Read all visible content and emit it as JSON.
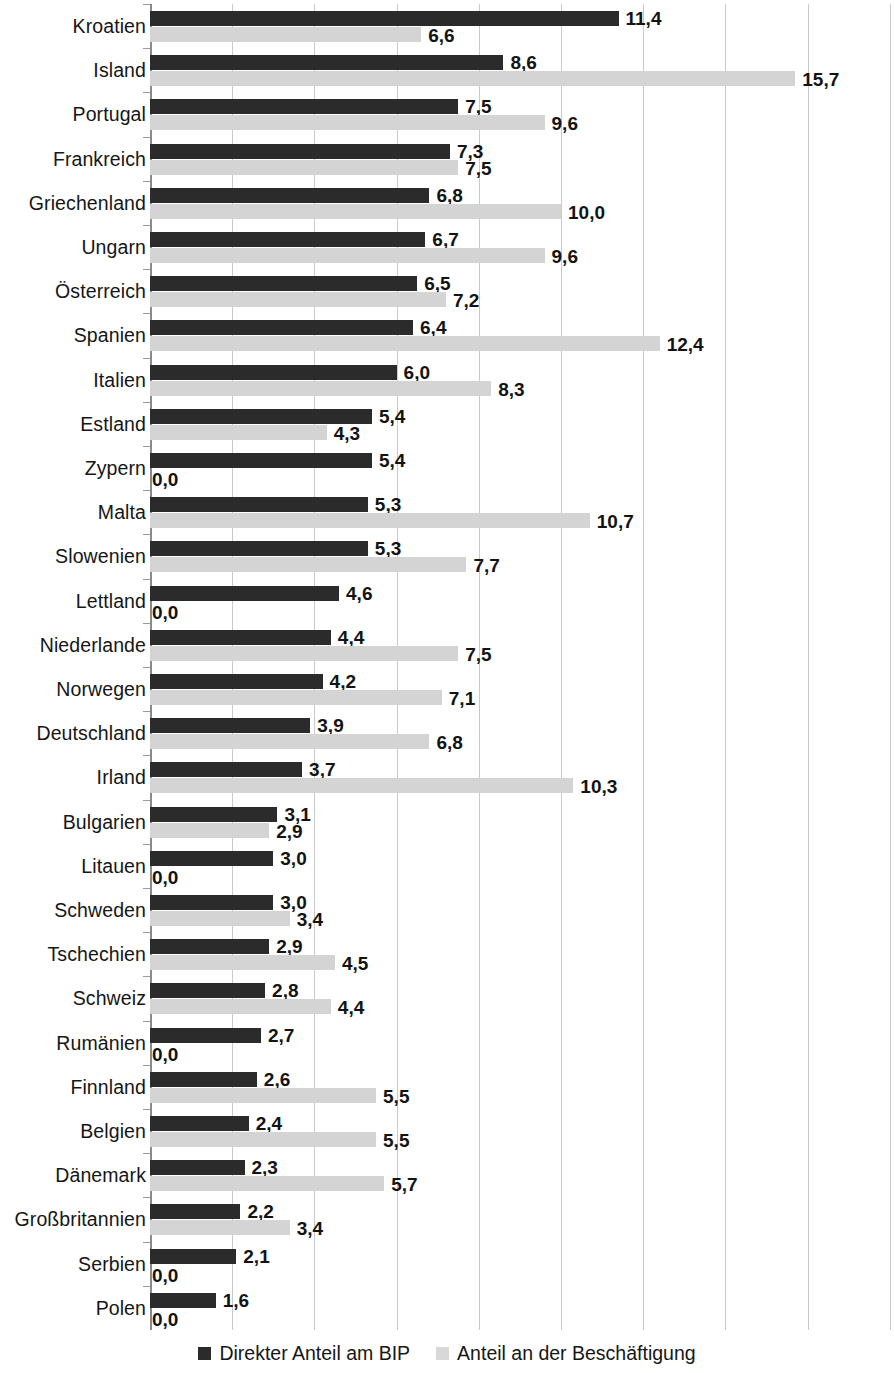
{
  "chart_data": {
    "type": "bar",
    "orientation": "horizontal",
    "title": "",
    "subtitle": "",
    "xlabel": "",
    "ylabel": "",
    "xlim": [
      0,
      18
    ],
    "grid": true,
    "gridline_values": [
      0,
      2,
      4,
      6,
      8,
      10,
      12,
      14,
      16,
      18
    ],
    "legend_position": "bottom",
    "value_format": "comma-decimal",
    "categories": [
      "Kroatien",
      "Island",
      "Portugal",
      "Frankreich",
      "Griechenland",
      "Ungarn",
      "Österreich",
      "Spanien",
      "Italien",
      "Estland",
      "Zypern",
      "Malta",
      "Slowenien",
      "Lettland",
      "Niederlande",
      "Norwegen",
      "Deutschland",
      "Irland",
      "Bulgarien",
      "Litauen",
      "Schweden",
      "Tschechien",
      "Schweiz",
      "Rumänien",
      "Finnland",
      "Belgien",
      "Dänemark",
      "Großbritannien",
      "Serbien",
      "Polen"
    ],
    "series": [
      {
        "name": "Direkter Anteil am BIP",
        "color": "#2b2b2b",
        "values": [
          11.4,
          8.6,
          7.5,
          7.3,
          6.8,
          6.7,
          6.5,
          6.4,
          6.0,
          5.4,
          5.4,
          5.3,
          5.3,
          4.6,
          4.4,
          4.2,
          3.9,
          3.7,
          3.1,
          3.0,
          3.0,
          2.9,
          2.8,
          2.7,
          2.6,
          2.4,
          2.3,
          2.2,
          2.1,
          1.6
        ],
        "labels": [
          "11,4",
          "8,6",
          "7,5",
          "7,3",
          "6,8",
          "6,7",
          "6,5",
          "6,4",
          "6,0",
          "5,4",
          "5,4",
          "5,3",
          "5,3",
          "4,6",
          "4,4",
          "4,2",
          "3,9",
          "3,7",
          "3,1",
          "3,0",
          "3,0",
          "2,9",
          "2,8",
          "2,7",
          "2,6",
          "2,4",
          "2,3",
          "2,2",
          "2,1",
          "1,6"
        ]
      },
      {
        "name": "Anteil an der Beschäftigung",
        "color": "#d4d4d4",
        "values": [
          6.6,
          15.7,
          9.6,
          7.5,
          10.0,
          9.6,
          7.2,
          12.4,
          8.3,
          4.3,
          0.0,
          10.7,
          7.7,
          0.0,
          7.5,
          7.1,
          6.8,
          10.3,
          2.9,
          0.0,
          3.4,
          4.5,
          4.4,
          0.0,
          5.5,
          5.5,
          5.7,
          3.4,
          0.0,
          0.0
        ],
        "labels": [
          "6,6",
          "15,7",
          "9,6",
          "7,5",
          "10,0",
          "9,6",
          "7,2",
          "12,4",
          "8,3",
          "4,3",
          "0,0",
          "10,7",
          "7,7",
          "0,0",
          "7,5",
          "7,1",
          "6,8",
          "10,3",
          "2,9",
          "0,0",
          "3,4",
          "4,5",
          "4,4",
          "0,0",
          "5,5",
          "5,5",
          "5,7",
          "3,4",
          "0,0",
          "0,0"
        ]
      }
    ]
  },
  "legend": {
    "items": [
      {
        "label": "Direkter Anteil am BIP",
        "swatch": "dark-square-icon"
      },
      {
        "label": "Anteil an der Beschäftigung",
        "swatch": "light-square-icon"
      }
    ]
  }
}
